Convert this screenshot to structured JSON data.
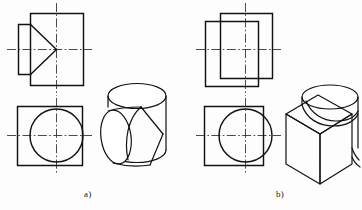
{
  "figure": {
    "background_color": "#fdfdfd",
    "line_color": "#121212",
    "centerline_color": "#2a2a2a",
    "width": 362,
    "height": 210
  },
  "captions": [
    {
      "id": "a",
      "label": "a)",
      "x": 84,
      "y": 189
    },
    {
      "id": "b",
      "label": "b)",
      "x": 276,
      "y": 189
    }
  ],
  "parts": [
    {
      "id": "a",
      "label": "a)",
      "description": "Horizontal cylinder with a V-shaped prismatic notch cut into the front face",
      "views": [
        {
          "name": "front-view",
          "type": "orthographic",
          "outline": "rectangle with stepped left edge and V-notch lines converging to the vertical centerline",
          "bounds": {
            "x": 18,
            "y": 12,
            "width": 66,
            "height": 74
          },
          "centerlines": [
            "vertical",
            "horizontal"
          ]
        },
        {
          "name": "top-view",
          "type": "orthographic",
          "outline": "square with inscribed circle tangent on three sides",
          "bounds": {
            "x": 16,
            "y": 104,
            "width": 68,
            "height": 62
          },
          "centerlines": [
            "vertical",
            "horizontal"
          ]
        },
        {
          "name": "pictorial-view",
          "type": "isometric",
          "outline": "cylinder standing with a wedge-shaped V groove cut from the front",
          "bounds": {
            "x": 96,
            "y": 84,
            "width": 82,
            "height": 88
          }
        }
      ]
    },
    {
      "id": "b",
      "label": "b)",
      "description": "Rectangular block with a cylinder protruding from the top surface",
      "views": [
        {
          "name": "front-view",
          "type": "orthographic",
          "outline": "two overlapping rectangles, a wide block and a narrower tall cylinder silhouette",
          "bounds": {
            "x": 204,
            "y": 12,
            "width": 68,
            "height": 74
          },
          "centerlines": [
            "vertical",
            "horizontal"
          ]
        },
        {
          "name": "top-view",
          "type": "orthographic",
          "outline": "square with a circle overlapping and projecting past the right edge",
          "bounds": {
            "x": 202,
            "y": 104,
            "width": 68,
            "height": 62
          },
          "centerlines": [
            "vertical",
            "horizontal"
          ]
        },
        {
          "name": "pictorial-view",
          "type": "isometric",
          "outline": "cube with a vertical cylinder rising from the top face",
          "bounds": {
            "x": 282,
            "y": 84,
            "width": 78,
            "height": 90
          }
        }
      ]
    }
  ]
}
